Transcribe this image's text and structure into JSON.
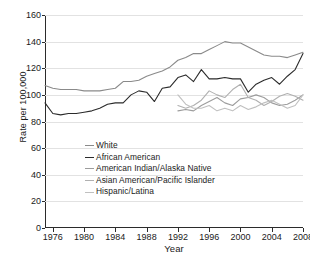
{
  "chart_data": {
    "type": "line",
    "title": "",
    "xlabel": "Year",
    "ylabel": "Rate per 100,000",
    "xlim": [
      1975,
      2008
    ],
    "ylim": [
      0,
      160
    ],
    "yticks": [
      0,
      20,
      40,
      60,
      80,
      100,
      120,
      140,
      160
    ],
    "xticks": [
      1976,
      1980,
      1984,
      1988,
      1992,
      1996,
      2000,
      2004,
      2008
    ],
    "grid": true,
    "legend_position": "lower-left-inside",
    "series": [
      {
        "name": "White",
        "color": "#8a8a8a",
        "x": [
          1975,
          1976,
          1977,
          1978,
          1979,
          1980,
          1981,
          1982,
          1983,
          1984,
          1985,
          1986,
          1987,
          1988,
          1989,
          1990,
          1991,
          1992,
          1993,
          1994,
          1995,
          1996,
          1997,
          1998,
          1999,
          2000,
          2001,
          2002,
          2003,
          2004,
          2005,
          2006,
          2007,
          2008
        ],
        "values": [
          107,
          105,
          104,
          104,
          104,
          103,
          103,
          103,
          104,
          105,
          110,
          110,
          111,
          114,
          116,
          118,
          121,
          126,
          128,
          131,
          131,
          134,
          137,
          140,
          139,
          139,
          136,
          133,
          130,
          129,
          129,
          128,
          130,
          132
        ]
      },
      {
        "name": "African American",
        "color": "#2b2b2b",
        "x": [
          1975,
          1976,
          1977,
          1978,
          1979,
          1980,
          1981,
          1982,
          1983,
          1984,
          1985,
          1986,
          1987,
          1988,
          1989,
          1990,
          1991,
          1992,
          1993,
          1994,
          1995,
          1996,
          1997,
          1998,
          1999,
          2000,
          2001,
          2002,
          2003,
          2004,
          2005,
          2006,
          2007,
          2008
        ],
        "values": [
          94,
          86,
          85,
          86,
          86,
          87,
          88,
          90,
          93,
          94,
          94,
          100,
          103,
          102,
          95,
          105,
          106,
          113,
          115,
          110,
          119,
          112,
          112,
          113,
          112,
          112,
          102,
          108,
          111,
          113,
          108,
          114,
          119,
          131
        ]
      },
      {
        "name": "American Indian/Alaska Native",
        "color": "#9c9c9c",
        "x": [
          1992,
          1993,
          1994,
          1995,
          1996,
          1997,
          1998,
          1999,
          2000,
          2001,
          2002,
          2003,
          2004,
          2005,
          2006,
          2007,
          2008
        ],
        "values": [
          88,
          89,
          88,
          92,
          95,
          98,
          94,
          92,
          97,
          98,
          100,
          98,
          94,
          92,
          93,
          96,
          100
        ]
      },
      {
        "name": "Asian American/Pacific Islander",
        "color": "#b0b0b0",
        "x": [
          1992,
          1993,
          1994,
          1995,
          1996,
          1997,
          1998,
          1999,
          2000,
          2001,
          2002,
          2003,
          2004,
          2005,
          2006,
          2007,
          2008
        ],
        "values": [
          92,
          90,
          92,
          96,
          103,
          100,
          98,
          104,
          108,
          98,
          96,
          92,
          95,
          99,
          101,
          99,
          96
        ]
      },
      {
        "name": "Hispanic/Latina",
        "color": "#c0c0c0",
        "x": [
          1992,
          1993,
          1994,
          1995,
          1996,
          1997,
          1998,
          1999,
          2000,
          2001,
          2002,
          2003,
          2004,
          2005,
          2006,
          2007,
          2008
        ],
        "values": [
          100,
          93,
          90,
          90,
          92,
          88,
          90,
          88,
          92,
          89,
          91,
          94,
          96,
          93,
          90,
          92,
          100
        ]
      }
    ]
  },
  "legend": {
    "items": [
      {
        "label": "White"
      },
      {
        "label": "African American"
      },
      {
        "label": "American Indian/Alaska Native"
      },
      {
        "label": "Asian American/Pacific Islander"
      },
      {
        "label": "Hispanic/Latina"
      }
    ]
  }
}
